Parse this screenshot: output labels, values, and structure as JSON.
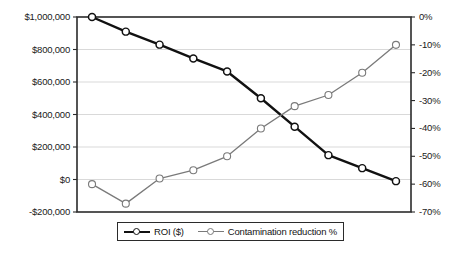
{
  "chart_data": {
    "type": "line",
    "title": "",
    "subtitle": "",
    "xlabel": "",
    "ylabel": "",
    "grid": true,
    "legend_position": "bottom",
    "x": [
      1,
      2,
      3,
      4,
      5,
      6,
      7,
      8,
      9,
      10
    ],
    "categories": [
      "1",
      "2",
      "3",
      "4",
      "5",
      "6",
      "7",
      "8",
      "9",
      "10"
    ],
    "axes": {
      "left": {
        "label": "",
        "ylim": [
          -200000,
          1000000
        ],
        "tick_values": [
          1000000,
          800000,
          600000,
          400000,
          200000,
          0,
          -200000
        ],
        "tick_labels": [
          "$1,000,000",
          "$800,000",
          "$600,000",
          "$400,000",
          "$200,000",
          "$0",
          "-$200,000"
        ]
      },
      "right": {
        "label": "",
        "ylim": [
          -70,
          0
        ],
        "tick_values": [
          0,
          -10,
          -20,
          -30,
          -40,
          -50,
          -60,
          -70
        ],
        "tick_labels": [
          "0%",
          "-10%",
          "-20%",
          "-30%",
          "-40%",
          "-50%",
          "-60%",
          "-70%"
        ]
      }
    },
    "series": [
      {
        "name": "ROI ($)",
        "axis": "left",
        "color": "#111111",
        "line_width": 2.4,
        "marker": "circle-open",
        "values": [
          1000000,
          910000,
          830000,
          745000,
          665000,
          500000,
          325000,
          150000,
          70000,
          -10000
        ]
      },
      {
        "name": "Contamination reduction %",
        "axis": "right",
        "color": "#7a7a7a",
        "line_width": 1.3,
        "marker": "circle-open",
        "values": [
          -60,
          -67,
          -58,
          -55,
          -50,
          -40,
          -32,
          -28,
          -20,
          -10
        ]
      }
    ]
  },
  "legend": {
    "items": [
      {
        "label": "ROI ($)"
      },
      {
        "label": "Contamination reduction %"
      }
    ]
  },
  "colors": {
    "roi_line": "#111111",
    "contamination_line": "#7a7a7a",
    "grid": "#c9c9c9",
    "axis": "#2b2b2b",
    "background": "#ffffff",
    "text": "#141414"
  }
}
